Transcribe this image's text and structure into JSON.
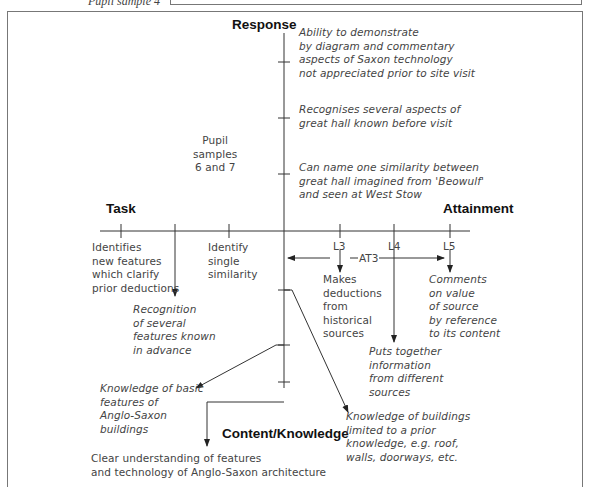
{
  "header": {
    "caption": "Pupil sample 4"
  },
  "axes": {
    "response": "Response",
    "task": "Task",
    "attainment": "Attainment",
    "content": "Content/Knowledge"
  },
  "response_items": [
    [
      "Ability to demonstrate",
      "by diagram and commentary",
      "aspects of Saxon technology",
      "not appreciated prior to site visit"
    ],
    [
      "Recognises several aspects of",
      "great hall known before visit"
    ],
    [
      "Can name one similarity between",
      "great hall imagined from 'Beowulf'",
      "and seen at West Stow"
    ]
  ],
  "pupil_note": [
    "Pupil",
    "samples",
    "6 and 7"
  ],
  "task_items": [
    [
      "Identifies",
      "new features",
      "which clarify",
      "prior deductions"
    ],
    [
      "Identify",
      "single",
      "similarity"
    ],
    [
      "Recognition",
      "of several",
      "features known",
      "in advance"
    ]
  ],
  "attainment": {
    "levels": [
      "L3",
      "L4",
      "L5"
    ],
    "range_label": "AT3",
    "items": [
      [
        "Makes",
        "deductions",
        "from",
        "historical",
        "sources"
      ],
      [
        "Puts together",
        "information",
        "from different",
        "sources"
      ],
      [
        "Comments",
        "on value",
        "of source",
        "by reference",
        "to its content"
      ]
    ]
  },
  "content_items": [
    [
      "Knowledge of basic",
      "features of",
      "Anglo-Saxon",
      "buildings"
    ],
    [
      "Clear understanding of features",
      "and technology of Anglo-Saxon architecture"
    ],
    [
      "Knowledge of buildings",
      "limited to a prior",
      "knowledge, e.g. roof,",
      "walls, doorways, etc."
    ]
  ],
  "colors": {
    "line": "#333333",
    "text": "#444444",
    "frame": "#777777"
  }
}
